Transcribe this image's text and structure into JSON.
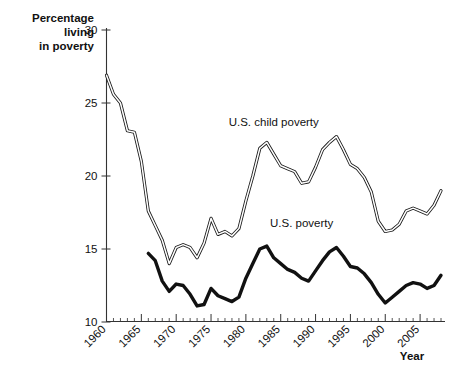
{
  "chart_data": {
    "type": "line",
    "title": "",
    "xlabel": "Year",
    "ylabel": "Percentage living in poverty",
    "ylabel_lines": [
      "Percentage",
      "living",
      "in poverty"
    ],
    "xlim": [
      1960,
      2008
    ],
    "ylim": [
      10,
      30
    ],
    "ytick_labels": [
      "10",
      "15",
      "20",
      "25",
      "30"
    ],
    "ytick_values": [
      10,
      15,
      20,
      25,
      30
    ],
    "xtick_labels": [
      "1960",
      "1965",
      "1970",
      "1975",
      "1980",
      "1985",
      "1990",
      "1995",
      "2000",
      "2005"
    ],
    "xtick_values": [
      1960,
      1965,
      1970,
      1975,
      1980,
      1985,
      1990,
      1995,
      2000,
      2005
    ],
    "minor_tick_step": 1,
    "grid": false,
    "legend_position": "inline-annotations",
    "series": [
      {
        "name": "U.S. child poverty",
        "style": "double-outline-line",
        "color": "#1a1a1a",
        "label_x": 1984,
        "label_y": 23.4,
        "x": [
          1960,
          1961,
          1962,
          1963,
          1964,
          1965,
          1966,
          1967,
          1968,
          1969,
          1970,
          1971,
          1972,
          1973,
          1974,
          1975,
          1976,
          1977,
          1978,
          1979,
          1980,
          1981,
          1982,
          1983,
          1984,
          1985,
          1986,
          1987,
          1988,
          1989,
          1990,
          1991,
          1992,
          1993,
          1994,
          1995,
          1996,
          1997,
          1998,
          1999,
          2000,
          2001,
          2002,
          2003,
          2004,
          2005,
          2006,
          2007,
          2008
        ],
        "values": [
          26.9,
          25.6,
          25.0,
          23.1,
          23.0,
          21.0,
          17.6,
          16.6,
          15.6,
          14.0,
          15.1,
          15.3,
          15.1,
          14.4,
          15.4,
          17.1,
          16.0,
          16.2,
          15.9,
          16.4,
          18.3,
          20.0,
          21.9,
          22.3,
          21.5,
          20.7,
          20.5,
          20.3,
          19.5,
          19.6,
          20.6,
          21.8,
          22.3,
          22.7,
          21.8,
          20.8,
          20.5,
          19.9,
          18.9,
          16.9,
          16.2,
          16.3,
          16.7,
          17.6,
          17.8,
          17.6,
          17.4,
          18.0,
          19.0
        ]
      },
      {
        "name": "U.S. poverty",
        "style": "solid-thick-line",
        "color": "#111111",
        "label_x": 1988,
        "label_y": 16.5,
        "x": [
          1966,
          1967,
          1968,
          1969,
          1970,
          1971,
          1972,
          1973,
          1974,
          1975,
          1976,
          1977,
          1978,
          1979,
          1980,
          1981,
          1982,
          1983,
          1984,
          1985,
          1986,
          1987,
          1988,
          1989,
          1990,
          1991,
          1992,
          1993,
          1994,
          1995,
          1996,
          1997,
          1998,
          1999,
          2000,
          2001,
          2002,
          2003,
          2004,
          2005,
          2006,
          2007,
          2008
        ],
        "values": [
          14.7,
          14.2,
          12.8,
          12.1,
          12.6,
          12.5,
          11.9,
          11.1,
          11.2,
          12.3,
          11.8,
          11.6,
          11.4,
          11.7,
          13.0,
          14.0,
          15.0,
          15.2,
          14.4,
          14.0,
          13.6,
          13.4,
          13.0,
          12.8,
          13.5,
          14.2,
          14.8,
          15.1,
          14.5,
          13.8,
          13.7,
          13.3,
          12.7,
          11.9,
          11.3,
          11.7,
          12.1,
          12.5,
          12.7,
          12.6,
          12.3,
          12.5,
          13.2
        ]
      }
    ]
  },
  "axis": {
    "y_title_line1": "Percentage",
    "y_title_line2": "living",
    "y_title_line3": "in poverty",
    "x_title": "Year"
  },
  "annotations": {
    "child_poverty_label": "U.S. child poverty",
    "poverty_label": "U.S. poverty"
  }
}
